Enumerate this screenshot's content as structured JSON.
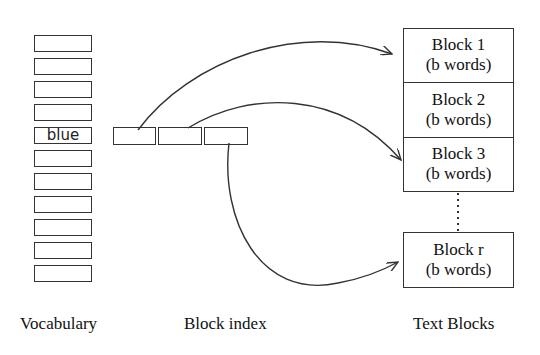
{
  "vocabulary": {
    "label": "Vocabulary",
    "entries": [
      "",
      "",
      "",
      "",
      "blue",
      "",
      "",
      "",
      "",
      "",
      ""
    ],
    "highlighted_word": "blue"
  },
  "block_index": {
    "label": "Block index",
    "entries": [
      "",
      "",
      ""
    ]
  },
  "text_blocks": {
    "label": "Text Blocks",
    "blocks": [
      {
        "title": "Block 1",
        "subtitle": "(b words)"
      },
      {
        "title": "Block 2",
        "subtitle": "(b words)"
      },
      {
        "title": "Block 3",
        "subtitle": "(b words)"
      },
      {
        "title": "Block r",
        "subtitle": "(b words)"
      }
    ],
    "ellipsis": "dotted"
  },
  "arrows": [
    {
      "from": "block_index.0",
      "to": "Block 1"
    },
    {
      "from": "block_index.1",
      "to": "Block 3"
    },
    {
      "from": "block_index.2",
      "to": "Block r"
    }
  ],
  "colors": {
    "stroke": "#333333",
    "background": "#ffffff",
    "text": "#111111"
  }
}
